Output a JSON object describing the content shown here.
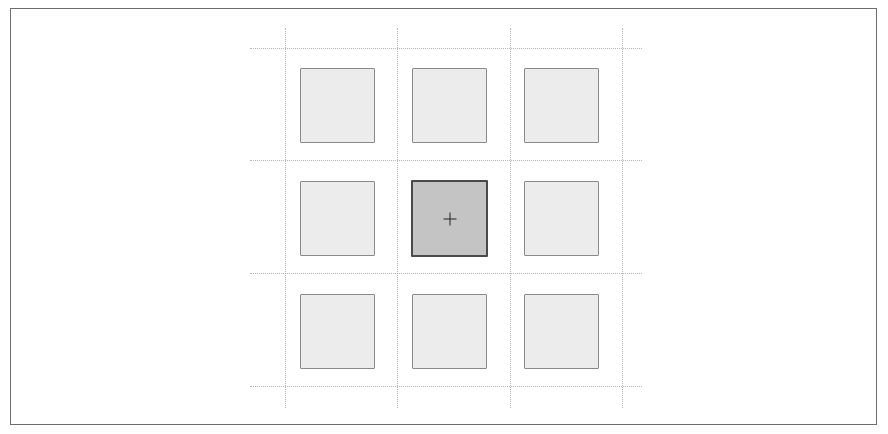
{
  "diagram": {
    "type": "3x3 grid selection",
    "rows": 3,
    "cols": 3,
    "selected_cell": {
      "row": 1,
      "col": 1
    },
    "colors": {
      "frame_border": "#6e6e6e",
      "guide_line": "#b5b5b5",
      "cell_fill": "#ececec",
      "cell_border": "#8a8a8a",
      "selected_fill": "#c4c4c4",
      "selected_border": "#4a4a4a"
    },
    "cells": [
      {
        "id": "r0c0",
        "selected": false
      },
      {
        "id": "r0c1",
        "selected": false
      },
      {
        "id": "r0c2",
        "selected": false
      },
      {
        "id": "r1c0",
        "selected": false
      },
      {
        "id": "r1c1",
        "selected": true,
        "icon": "crosshair-icon"
      },
      {
        "id": "r1c2",
        "selected": false
      },
      {
        "id": "r2c0",
        "selected": false
      },
      {
        "id": "r2c1",
        "selected": false
      },
      {
        "id": "r2c2",
        "selected": false
      }
    ]
  }
}
